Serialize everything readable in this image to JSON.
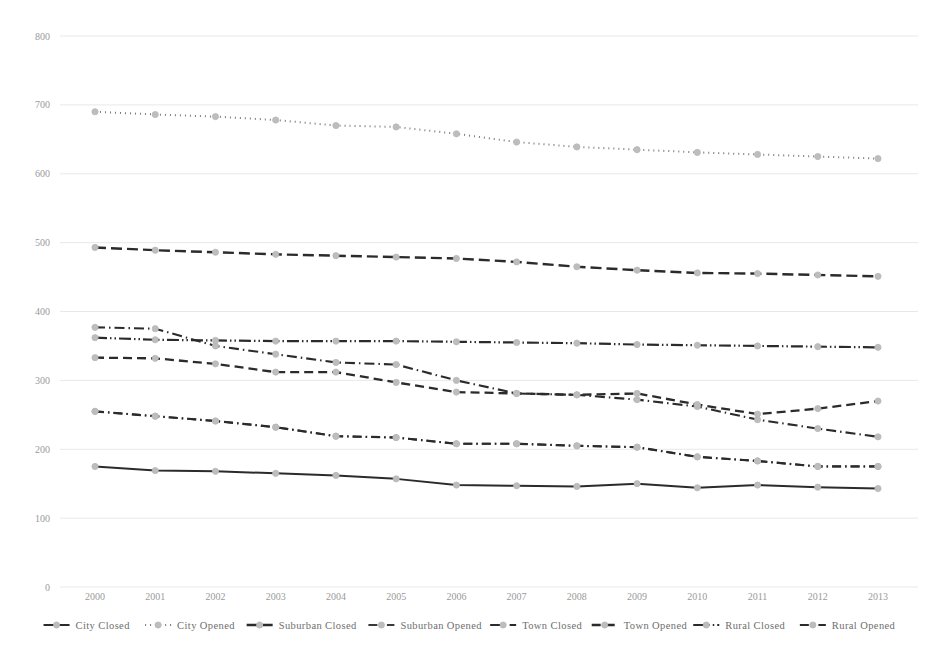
{
  "chart_data": {
    "type": "line",
    "title": "",
    "subtitle": "",
    "xlabel": "",
    "ylabel": "",
    "xlim": [
      2000,
      2013
    ],
    "ylim": [
      0,
      800
    ],
    "ytick_step": 100,
    "grid": true,
    "legend_position": "bottom",
    "x": [
      2000,
      2001,
      2002,
      2003,
      2004,
      2005,
      2006,
      2007,
      2008,
      2009,
      2010,
      2011,
      2012,
      2013
    ],
    "categories": [
      "2000",
      "2001",
      "2002",
      "2003",
      "2004",
      "2005",
      "2006",
      "2007",
      "2008",
      "2009",
      "2010",
      "2011",
      "2012",
      "2013"
    ],
    "yticks": [
      "0",
      "100",
      "200",
      "300",
      "400",
      "500",
      "600",
      "700",
      "800"
    ],
    "series": [
      {
        "name": "City Closed",
        "style": "solid",
        "color": "#2b2b2b",
        "width": 2.0,
        "dash": "",
        "values": [
          175,
          169,
          168,
          165,
          162,
          157,
          148,
          147,
          146,
          150,
          144,
          148,
          145,
          143
        ]
      },
      {
        "name": "City Opened",
        "style": "dotted",
        "color": "#7a7a7a",
        "width": 2.0,
        "dash": "1,4",
        "values": [
          690,
          686,
          683,
          678,
          670,
          668,
          658,
          646,
          639,
          635,
          631,
          628,
          625,
          622
        ]
      },
      {
        "name": "Suburban Closed",
        "style": "long-dash",
        "color": "#2b2b2b",
        "width": 2.4,
        "dash": "11,5",
        "values": [
          493,
          489,
          486,
          483,
          481,
          479,
          477,
          472,
          465,
          460,
          456,
          455,
          453,
          451
        ]
      },
      {
        "name": "Suburban Opened",
        "style": "dash-dot",
        "color": "#3a3a3a",
        "width": 1.9,
        "dash": "9,4,1.5,4",
        "values": [
          255,
          248,
          241,
          232,
          219,
          217,
          208,
          208,
          205,
          203,
          189,
          183,
          175,
          175
        ]
      },
      {
        "name": "Town Closed",
        "style": "dash-dot",
        "color": "#2b2b2b",
        "width": 2.1,
        "dash": "10,4,1.5,4",
        "values": [
          377,
          375,
          350,
          338,
          326,
          323,
          300,
          281,
          279,
          272,
          262,
          243,
          230,
          218
        ]
      },
      {
        "name": "Town Opened",
        "style": "dashed",
        "color": "#2b2b2b",
        "width": 2.3,
        "dash": "9,5",
        "values": [
          333,
          332,
          324,
          312,
          312,
          297,
          283,
          281,
          279,
          281,
          265,
          251,
          259,
          270
        ]
      },
      {
        "name": "Rural Closed",
        "style": "dash-dot-dot",
        "color": "#2b2b2b",
        "width": 2.2,
        "dash": "12,3,1.5,3,1.5,3",
        "values": [
          362,
          359,
          358,
          357,
          357,
          357,
          356,
          355,
          354,
          352,
          351,
          350,
          349,
          348
        ]
      },
      {
        "name": "Rural Opened",
        "style": "dash-dot",
        "color": "#2b2b2b",
        "width": 2.2,
        "dash": "9,4,1.5,4",
        "values": [
          255,
          248,
          241,
          232,
          219,
          217,
          208,
          208,
          205,
          203,
          189,
          183,
          175,
          175
        ]
      }
    ],
    "legend": [
      "City Closed",
      "City Opened",
      "Suburban Closed",
      "Suburban Opened",
      "Town Closed",
      "Town Opened",
      "Rural Closed",
      "Rural Opened"
    ]
  }
}
